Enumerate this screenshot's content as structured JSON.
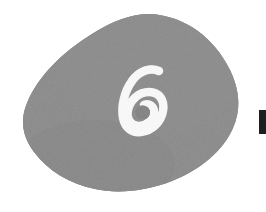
{
  "image": {
    "kind": "scanned-illustration",
    "width": 266,
    "height": 212,
    "background_color": "#ffffff",
    "caption": "Textured gray teardrop shape with a white handwritten numeral"
  },
  "blob": {
    "name": "teardrop-blob",
    "fill_color": "#8b8b8b",
    "fill_color_light": "#959595",
    "fill_color_dark": "#7e7e7e",
    "texture": "grainy-noise",
    "bounds": {
      "x": 22,
      "y": 14,
      "width": 219,
      "height": 180
    }
  },
  "numeral": {
    "value": "6",
    "color": "#f7f7f7",
    "style": "handwritten-brush",
    "bounds": {
      "x": 122,
      "y": 68,
      "width": 42,
      "height": 64
    }
  },
  "edge_mark": {
    "name": "page-edge-bar",
    "color": "#1e1e1e",
    "bounds": {
      "x": 259,
      "y": 110,
      "width": 7,
      "height": 24
    }
  }
}
